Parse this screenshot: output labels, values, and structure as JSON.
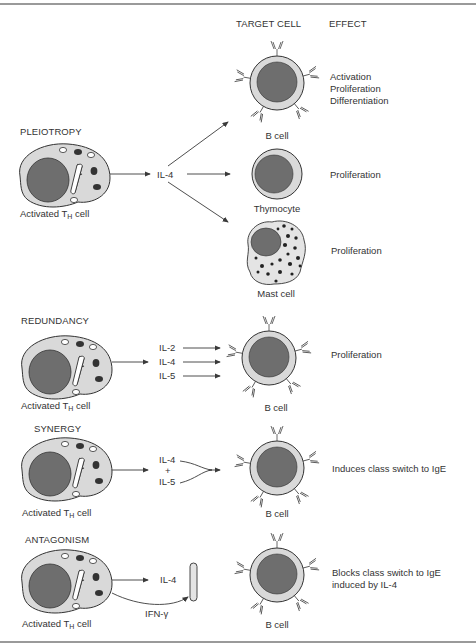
{
  "columns": {
    "target_cell": "TARGET CELL",
    "effect": "EFFECT"
  },
  "source_cell": {
    "label_main": "Activated T",
    "label_sub": "H",
    "label_tail": " cell"
  },
  "sections": [
    {
      "title": "PLEIOTROPY",
      "cytokines": [
        "IL-4"
      ],
      "targets": [
        {
          "cell": "B cell",
          "effect": [
            "Activation",
            "Proliferation",
            "Differentiation"
          ]
        },
        {
          "cell": "Thymocyte",
          "effect": [
            "Proliferation"
          ]
        },
        {
          "cell": "Mast cell",
          "effect": [
            "Proliferation"
          ]
        }
      ]
    },
    {
      "title": "REDUNDANCY",
      "cytokines": [
        "IL-2",
        "IL-4",
        "IL-5"
      ],
      "targets": [
        {
          "cell": "B cell",
          "effect": [
            "Proliferation"
          ]
        }
      ]
    },
    {
      "title": "SYNERGY",
      "cytokines": [
        "IL-4",
        "+",
        "IL-5"
      ],
      "targets": [
        {
          "cell": "B cell",
          "effect": [
            "Induces class switch to IgE"
          ]
        }
      ]
    },
    {
      "title": "ANTAGONISM",
      "cytokines": [
        "IL-4",
        "IFN-γ"
      ],
      "targets": [
        {
          "cell": "B cell",
          "effect": [
            "Blocks class switch to IgE",
            "induced by IL-4"
          ]
        }
      ]
    }
  ],
  "colors": {
    "cytoplasm": "#d9d9d9",
    "nucleus": "#6e6e6e",
    "line": "#3a3a3a",
    "rule": "#9a9a9a"
  }
}
